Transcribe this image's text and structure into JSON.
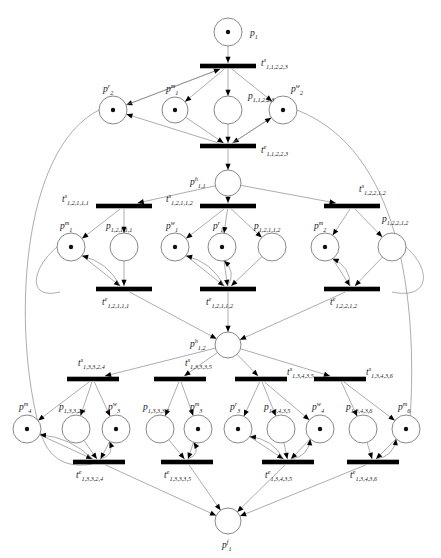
{
  "diagram": {
    "type": "petri-net",
    "width": 441,
    "height": 558,
    "colors": {
      "background": "#ffffff",
      "arc": "#8a8a8a",
      "place_stroke": "#7a7a7a",
      "transition": "#000000",
      "token": "#111111",
      "label": "#1a1a1a"
    }
  },
  "places": [
    {
      "id": "p1",
      "base": "p",
      "sup": "",
      "sub": "1",
      "x": 228,
      "y": 32,
      "r": 14,
      "tokens": 1,
      "label_dx": 22,
      "label_dy": 4,
      "name": "place-p-1"
    },
    {
      "id": "pr2",
      "base": "p",
      "sup": "r",
      "sub": "2",
      "x": 113,
      "y": 110,
      "r": 14,
      "tokens": 1,
      "label_dx": -10,
      "label_dy": -18,
      "name": "place-pr-2"
    },
    {
      "id": "pm1t",
      "base": "p",
      "sup": "m",
      "sub": "1",
      "x": 175,
      "y": 110,
      "r": 13,
      "tokens": 1,
      "label_dx": -9,
      "label_dy": -18,
      "name": "place-pm-1-top"
    },
    {
      "id": "p11223",
      "base": "p",
      "sup": "",
      "sub": "1,1,2,2,3",
      "x": 228,
      "y": 110,
      "r": 14,
      "tokens": 0,
      "label_dx": 20,
      "label_dy": -11,
      "name": "place-p-11223"
    },
    {
      "id": "pw2",
      "base": "p",
      "sup": "w",
      "sub": "2",
      "x": 283,
      "y": 110,
      "r": 14,
      "tokens": 1,
      "label_dx": 8,
      "label_dy": -18,
      "name": "place-pw-2"
    },
    {
      "id": "ph11",
      "base": "p",
      "sup": "h",
      "sub": "1,1",
      "x": 228,
      "y": 183,
      "r": 13,
      "tokens": 0,
      "label_dx": -38,
      "label_dy": 2,
      "name": "place-ph-11"
    },
    {
      "id": "pm1",
      "base": "p",
      "sup": "m",
      "sub": "1",
      "x": 71,
      "y": 247,
      "r": 14,
      "tokens": 1,
      "label_dx": -11,
      "label_dy": -18,
      "name": "place-pm-1"
    },
    {
      "id": "p12111",
      "base": "p",
      "sup": "",
      "sub": "1,2,1,1,1",
      "x": 124,
      "y": 247,
      "r": 14,
      "tokens": 0,
      "label_dx": -18,
      "label_dy": -18,
      "name": "place-p-12111"
    },
    {
      "id": "pw1",
      "base": "p",
      "sup": "w",
      "sub": "1",
      "x": 175,
      "y": 247,
      "r": 14,
      "tokens": 1,
      "label_dx": -9,
      "label_dy": -18,
      "name": "place-pw-1"
    },
    {
      "id": "pr1",
      "base": "p",
      "sup": "r",
      "sub": "1",
      "x": 222,
      "y": 247,
      "r": 14,
      "tokens": 1,
      "label_dx": -9,
      "label_dy": -18,
      "name": "place-pr-1"
    },
    {
      "id": "p12112",
      "base": "p",
      "sup": "",
      "sub": "1,2,1,1,2",
      "x": 272,
      "y": 247,
      "r": 14,
      "tokens": 0,
      "label_dx": -18,
      "label_dy": -18,
      "name": "place-p-12112"
    },
    {
      "id": "pm2",
      "base": "p",
      "sup": "m",
      "sub": "2",
      "x": 325,
      "y": 247,
      "r": 14,
      "tokens": 1,
      "label_dx": -11,
      "label_dy": -18,
      "name": "place-pm-2"
    },
    {
      "id": "p12212",
      "base": "p",
      "sup": "",
      "sub": "1,2,2,1,2",
      "x": 392,
      "y": 247,
      "r": 14,
      "tokens": 0,
      "label_dx": -10,
      "label_dy": -25,
      "name": "place-p-12212"
    },
    {
      "id": "ph12",
      "base": "p",
      "sup": "h",
      "sub": "1,2",
      "x": 228,
      "y": 345,
      "r": 13,
      "tokens": 0,
      "label_dx": -38,
      "label_dy": 2,
      "name": "place-ph-12"
    },
    {
      "id": "pm4",
      "base": "p",
      "sup": "m",
      "sub": "4",
      "x": 27,
      "y": 429,
      "r": 14,
      "tokens": 1,
      "label_dx": -8,
      "label_dy": -19,
      "name": "place-pm-4"
    },
    {
      "id": "p13324",
      "base": "p",
      "sup": "",
      "sub": "1,3,3,2,4",
      "x": 76,
      "y": 429,
      "r": 14,
      "tokens": 0,
      "label_dx": -17,
      "label_dy": -19,
      "name": "place-p-13324"
    },
    {
      "id": "pw3",
      "base": "p",
      "sup": "w",
      "sub": "3",
      "x": 116,
      "y": 429,
      "r": 14,
      "tokens": 1,
      "label_dx": -8,
      "label_dy": -19,
      "name": "place-pw-3"
    },
    {
      "id": "p13335",
      "base": "p",
      "sup": "",
      "sub": "1,3,3,3,5",
      "x": 160,
      "y": 429,
      "r": 14,
      "tokens": 0,
      "label_dx": -17,
      "label_dy": -19,
      "name": "place-p-13335"
    },
    {
      "id": "pm3",
      "base": "p",
      "sup": "m",
      "sub": "3",
      "x": 198,
      "y": 429,
      "r": 14,
      "tokens": 1,
      "label_dx": -8,
      "label_dy": -19,
      "name": "place-pm-3"
    },
    {
      "id": "pr3",
      "base": "p",
      "sup": "r",
      "sub": "3",
      "x": 238,
      "y": 429,
      "r": 14,
      "tokens": 1,
      "label_dx": -8,
      "label_dy": -19,
      "name": "place-pr-3"
    },
    {
      "id": "p13435",
      "base": "p",
      "sup": "",
      "sub": "1,3,4,3,5",
      "x": 281,
      "y": 429,
      "r": 14,
      "tokens": 0,
      "label_dx": -17,
      "label_dy": -19,
      "name": "place-p-13435"
    },
    {
      "id": "pw4",
      "base": "p",
      "sup": "w",
      "sub": "4",
      "x": 320,
      "y": 429,
      "r": 14,
      "tokens": 1,
      "label_dx": -8,
      "label_dy": -19,
      "name": "place-pw-4"
    },
    {
      "id": "p13436",
      "base": "p",
      "sup": "",
      "sub": "1,3,4,3,6",
      "x": 363,
      "y": 429,
      "r": 14,
      "tokens": 0,
      "label_dx": -17,
      "label_dy": -19,
      "name": "place-p-13436"
    },
    {
      "id": "pm6",
      "base": "p",
      "sup": "m",
      "sub": "6",
      "x": 406,
      "y": 429,
      "r": 14,
      "tokens": 1,
      "label_dx": -8,
      "label_dy": -19,
      "name": "place-pm-6"
    },
    {
      "id": "pf1",
      "base": "p",
      "sup": "f",
      "sub": "1",
      "x": 228,
      "y": 521,
      "r": 13,
      "tokens": 0,
      "label_dx": -6,
      "label_dy": 27,
      "name": "place-pf-1"
    }
  ],
  "transitions": [
    {
      "id": "ts11223",
      "base": "t",
      "sup": "s",
      "sub": "1,1,2,2,3",
      "x": 228,
      "y": 66,
      "w": 56,
      "label_dx": 33,
      "label_dy": 0,
      "name": "transition-ts-11223"
    },
    {
      "id": "te11223",
      "base": "t",
      "sup": "e",
      "sub": "1,1,2,2,3",
      "x": 228,
      "y": 146,
      "w": 56,
      "label_dx": 33,
      "label_dy": 7,
      "name": "transition-te-11223"
    },
    {
      "id": "ts12111",
      "base": "t",
      "sup": "s",
      "sub": "1,2,1,1,1",
      "x": 124,
      "y": 206,
      "w": 56,
      "label_dx": -62,
      "label_dy": -4,
      "name": "transition-ts-12111"
    },
    {
      "id": "ts12112",
      "base": "t",
      "sup": "s",
      "sub": "1,2,1,1,2",
      "x": 228,
      "y": 206,
      "w": 56,
      "label_dx": -62,
      "label_dy": -4,
      "name": "transition-ts-12112"
    },
    {
      "id": "ts12212",
      "base": "t",
      "sup": "s",
      "sub": "1,2,2,1,2",
      "x": 352,
      "y": 206,
      "w": 56,
      "label_dx": 7,
      "label_dy": -14,
      "name": "transition-ts-12212"
    },
    {
      "id": "te12111",
      "base": "t",
      "sup": "e",
      "sub": "1,2,1,1,1",
      "x": 124,
      "y": 289,
      "w": 56,
      "label_dx": -22,
      "label_dy": 16,
      "name": "transition-te-12111"
    },
    {
      "id": "te12112",
      "base": "t",
      "sup": "e",
      "sub": "1,2,1,1,2",
      "x": 228,
      "y": 289,
      "w": 56,
      "label_dx": -22,
      "label_dy": 16,
      "name": "transition-te-12112"
    },
    {
      "id": "te12212",
      "base": "t",
      "sup": "e",
      "sub": "1,2,2,1,2",
      "x": 352,
      "y": 289,
      "w": 56,
      "label_dx": -22,
      "label_dy": 16,
      "name": "transition-te-12212"
    },
    {
      "id": "ts13324",
      "base": "t",
      "sup": "s",
      "sub": "1,3,3,2,4",
      "x": 93,
      "y": 379,
      "w": 52,
      "label_dx": -15,
      "label_dy": -13,
      "name": "transition-ts-13324"
    },
    {
      "id": "ts13335",
      "base": "t",
      "sup": "s",
      "sub": "1,3,3,3,5",
      "x": 180,
      "y": 379,
      "w": 52,
      "label_dx": 5,
      "label_dy": -13,
      "name": "transition-ts-13335"
    },
    {
      "id": "ts13435",
      "base": "t",
      "sup": "s",
      "sub": "1,3,4,3,5",
      "x": 261,
      "y": 379,
      "w": 52,
      "label_dx": 26,
      "label_dy": -4,
      "name": "transition-ts-13435"
    },
    {
      "id": "ts13436",
      "base": "t",
      "sup": "s",
      "sub": "1,3,4,3,6",
      "x": 340,
      "y": 379,
      "w": 52,
      "label_dx": 26,
      "label_dy": -4,
      "name": "transition-ts-13436"
    },
    {
      "id": "te13324",
      "base": "t",
      "sup": "e",
      "sub": "1,3,3,2,4",
      "x": 99,
      "y": 462,
      "w": 52,
      "label_dx": -23,
      "label_dy": 16,
      "name": "transition-te-13324"
    },
    {
      "id": "te13335",
      "base": "t",
      "sup": "e",
      "sub": "1,3,3,3,5",
      "x": 187,
      "y": 462,
      "w": 52,
      "label_dx": -23,
      "label_dy": 16,
      "name": "transition-te-13335"
    },
    {
      "id": "te13435",
      "base": "t",
      "sup": "e",
      "sub": "1,3,4,3,5",
      "x": 288,
      "y": 462,
      "w": 52,
      "label_dx": -23,
      "label_dy": 16,
      "name": "transition-te-13435"
    },
    {
      "id": "te13436",
      "base": "t",
      "sup": "e",
      "sub": "1,3,4,3,6",
      "x": 373,
      "y": 462,
      "w": 52,
      "label_dx": -23,
      "label_dy": 16,
      "name": "transition-te-13436"
    }
  ],
  "arcs": [
    {
      "from": "p1",
      "to": "ts11223",
      "kind": "straight"
    },
    {
      "from": "ts11223",
      "to": "pr2",
      "kind": "straight"
    },
    {
      "from": "ts11223",
      "to": "pm1t",
      "kind": "straight"
    },
    {
      "from": "ts11223",
      "to": "p11223",
      "kind": "straight"
    },
    {
      "from": "ts11223",
      "to": "pw2",
      "kind": "straight"
    },
    {
      "from": "pr2",
      "to": "ts11223",
      "kind": "straight"
    },
    {
      "from": "pm1t",
      "to": "te11223",
      "kind": "straight"
    },
    {
      "from": "p11223",
      "to": "te11223",
      "kind": "straight"
    },
    {
      "from": "pw2",
      "to": "te11223",
      "kind": "straight"
    },
    {
      "from": "te11223",
      "to": "ph11",
      "kind": "straight"
    },
    {
      "from": "te11223",
      "to": "pr2",
      "kind": "straight"
    },
    {
      "from": "te11223",
      "to": "pw2",
      "kind": "straight"
    },
    {
      "from": "ph11",
      "to": "ts12111",
      "kind": "straight"
    },
    {
      "from": "ph11",
      "to": "ts12112",
      "kind": "straight"
    },
    {
      "from": "ph11",
      "to": "ts12212",
      "kind": "straight"
    },
    {
      "from": "ts12111",
      "to": "pm1",
      "kind": "straight"
    },
    {
      "from": "ts12111",
      "to": "p12111",
      "kind": "straight"
    },
    {
      "from": "ts12112",
      "to": "pw1",
      "kind": "straight"
    },
    {
      "from": "ts12112",
      "to": "pr1",
      "kind": "straight"
    },
    {
      "from": "ts12112",
      "to": "p12112",
      "kind": "straight"
    },
    {
      "from": "ts12212",
      "to": "pm2",
      "kind": "straight"
    },
    {
      "from": "ts12212",
      "to": "p12212",
      "kind": "straight"
    },
    {
      "from": "pm1",
      "to": "te12111",
      "kind": "straight"
    },
    {
      "from": "p12111",
      "to": "te12111",
      "kind": "straight"
    },
    {
      "from": "pw1",
      "to": "te12112",
      "kind": "straight"
    },
    {
      "from": "pr1",
      "to": "te12112",
      "kind": "straight"
    },
    {
      "from": "p12112",
      "to": "te12112",
      "kind": "straight"
    },
    {
      "from": "pm2",
      "to": "te12212",
      "kind": "straight"
    },
    {
      "from": "p12212",
      "to": "te12212",
      "kind": "straight"
    },
    {
      "from": "te12111",
      "to": "ph12",
      "kind": "straight"
    },
    {
      "from": "te12112",
      "to": "ph12",
      "kind": "straight"
    },
    {
      "from": "te12212",
      "to": "ph12",
      "kind": "straight"
    },
    {
      "from": "ph12",
      "to": "ts13324",
      "kind": "straight"
    },
    {
      "from": "ph12",
      "to": "ts13335",
      "kind": "straight"
    },
    {
      "from": "ph12",
      "to": "ts13435",
      "kind": "straight"
    },
    {
      "from": "ph12",
      "to": "ts13436",
      "kind": "straight"
    },
    {
      "from": "ts13324",
      "to": "pm4",
      "kind": "straight"
    },
    {
      "from": "ts13324",
      "to": "p13324",
      "kind": "straight"
    },
    {
      "from": "ts13324",
      "to": "pw3",
      "kind": "straight"
    },
    {
      "from": "ts13335",
      "to": "p13335",
      "kind": "straight"
    },
    {
      "from": "ts13335",
      "to": "pm3",
      "kind": "straight"
    },
    {
      "from": "ts13435",
      "to": "pr3",
      "kind": "straight"
    },
    {
      "from": "ts13435",
      "to": "p13435",
      "kind": "straight"
    },
    {
      "from": "ts13435",
      "to": "pw4",
      "kind": "straight"
    },
    {
      "from": "ts13436",
      "to": "p13436",
      "kind": "straight"
    },
    {
      "from": "ts13436",
      "to": "pm6",
      "kind": "straight"
    },
    {
      "from": "pm4",
      "to": "te13324",
      "kind": "straight"
    },
    {
      "from": "p13324",
      "to": "te13324",
      "kind": "straight"
    },
    {
      "from": "pw3",
      "to": "te13324",
      "kind": "straight"
    },
    {
      "from": "p13335",
      "to": "te13335",
      "kind": "straight"
    },
    {
      "from": "pm3",
      "to": "te13335",
      "kind": "straight"
    },
    {
      "from": "pr3",
      "to": "te13435",
      "kind": "straight"
    },
    {
      "from": "p13435",
      "to": "te13435",
      "kind": "straight"
    },
    {
      "from": "pw4",
      "to": "te13435",
      "kind": "straight"
    },
    {
      "from": "p13436",
      "to": "te13436",
      "kind": "straight"
    },
    {
      "from": "pm6",
      "to": "te13436",
      "kind": "straight"
    },
    {
      "from": "te13324",
      "to": "pf1",
      "kind": "straight"
    },
    {
      "from": "te13335",
      "to": "pf1",
      "kind": "straight"
    },
    {
      "from": "te13435",
      "to": "pf1",
      "kind": "straight"
    },
    {
      "from": "te13436",
      "to": "pf1",
      "kind": "straight"
    }
  ],
  "resource_loops": [
    {
      "from": "te12111",
      "to": "pm1",
      "name": "loop-te12111-pm1"
    },
    {
      "from": "te12112",
      "to": "pw1",
      "name": "loop-te12112-pw1"
    },
    {
      "from": "te12112",
      "to": "pr1",
      "name": "loop-te12112-pr1"
    },
    {
      "from": "te12212",
      "to": "pm2",
      "name": "loop-te12212-pm2"
    },
    {
      "from": "te13324",
      "to": "pm4",
      "name": "loop-te13324-pm4"
    },
    {
      "from": "te13324",
      "to": "pw3",
      "name": "loop-te13324-pw3"
    },
    {
      "from": "te13335",
      "to": "pm3",
      "name": "loop-te13335-pm3"
    },
    {
      "from": "te13435",
      "to": "pr3",
      "name": "loop-te13435-pr3"
    },
    {
      "from": "te13435",
      "to": "pw4",
      "name": "loop-te13435-pw4"
    },
    {
      "from": "te13436",
      "to": "pm6",
      "name": "loop-te13436-pm6"
    }
  ],
  "global_loops": [
    {
      "id": "g1",
      "d": "M 99 110 C 20 150 12 330 40 430 C 48 462 70 468 92 464",
      "name": "global-arc-left-pr2"
    },
    {
      "id": "g2",
      "d": "M 297 110 C 400 150 418 300 410 420",
      "name": "global-arc-right-pw2"
    },
    {
      "id": "g3",
      "d": "M 57 247 C 30 270 28 300 60 292",
      "name": "global-arc-pm1-te12111"
    },
    {
      "id": "g4",
      "d": "M 406 247 C 432 270 430 300 392 292",
      "name": "global-arc-p12212-te12212"
    }
  ]
}
